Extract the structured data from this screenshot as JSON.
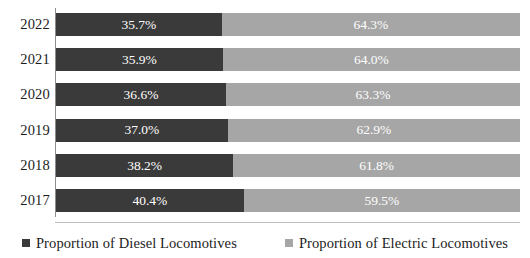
{
  "chart_data": {
    "type": "bar",
    "orientation": "horizontal",
    "stacked": true,
    "normalized_percent": true,
    "title": "",
    "subtitle": "",
    "xlabel": "",
    "ylabel": "",
    "xlim": [
      0,
      100
    ],
    "grid": false,
    "legend_position": "bottom",
    "categories": [
      "2022",
      "2021",
      "2020",
      "2019",
      "2018",
      "2017"
    ],
    "series": [
      {
        "name": "Proportion of Diesel Locomotives",
        "color": "#3A3A3A",
        "values": [
          35.7,
          35.9,
          36.6,
          37.0,
          38.2,
          40.4
        ],
        "labels": [
          "35.7%",
          "35.9%",
          "36.6%",
          "37.0%",
          "38.2%",
          "40.4%"
        ]
      },
      {
        "name": "Proportion of Electric Locomotives",
        "color": "#A6A6A6",
        "values": [
          64.3,
          64.0,
          63.3,
          62.9,
          61.8,
          59.5
        ],
        "labels": [
          "64.3%",
          "64.0%",
          "63.3%",
          "62.9%",
          "61.8%",
          "59.5%"
        ]
      }
    ]
  },
  "axis": {
    "category_labels": [
      "2022",
      "2021",
      "2020",
      "2019",
      "2018",
      "2017"
    ]
  },
  "rows": [
    {
      "category": "2022",
      "diesel_label": "35.7%",
      "electric_label": "64.3%",
      "diesel_pct": 35.7,
      "electric_pct": 64.3
    },
    {
      "category": "2021",
      "diesel_label": "35.9%",
      "electric_label": "64.0%",
      "diesel_pct": 35.9,
      "electric_pct": 64.0
    },
    {
      "category": "2020",
      "diesel_label": "36.6%",
      "electric_label": "63.3%",
      "diesel_pct": 36.6,
      "electric_pct": 63.3
    },
    {
      "category": "2019",
      "diesel_label": "37.0%",
      "electric_label": "62.9%",
      "diesel_pct": 37.0,
      "electric_pct": 62.9
    },
    {
      "category": "2018",
      "diesel_label": "38.2%",
      "electric_label": "61.8%",
      "diesel_pct": 38.2,
      "electric_pct": 61.8
    },
    {
      "category": "2017",
      "diesel_label": "40.4%",
      "electric_label": "59.5%",
      "diesel_pct": 40.4,
      "electric_pct": 59.5
    }
  ],
  "legend": {
    "items": [
      {
        "label": "Proportion of Diesel Locomotives",
        "marker": "square-marker",
        "color": "#3A3A3A"
      },
      {
        "label": "Proportion of Electric Locomotives",
        "marker": "square-marker",
        "color": "#A6A6A6"
      }
    ]
  },
  "colors": {
    "diesel": "#3A3A3A",
    "electric": "#A6A6A6",
    "axis": "#8C8C8C",
    "divider": "#BFBFBF",
    "text": "#1C1C1C",
    "bar_label_text": "#FFFFFF",
    "background": "#FFFFFF"
  }
}
